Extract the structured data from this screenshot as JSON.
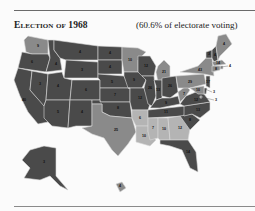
{
  "header": {
    "title": "Election of 1968",
    "subtitle": "(60.6% of electorate voting)"
  },
  "legend_colors": {
    "nixon_republican": "#4a4a4a",
    "humphrey_democratic": "#8a8a8a",
    "wallace_american_independent": "#b4b4b4"
  },
  "states": [
    {
      "abbr": "WA",
      "ev": "9",
      "party": "humphrey_democratic"
    },
    {
      "abbr": "OR",
      "ev": "6",
      "party": "nixon_republican"
    },
    {
      "abbr": "CA",
      "ev": "40",
      "party": "nixon_republican"
    },
    {
      "abbr": "NV",
      "ev": "3",
      "party": "nixon_republican"
    },
    {
      "abbr": "ID",
      "ev": "4",
      "party": "nixon_republican"
    },
    {
      "abbr": "MT",
      "ev": "4",
      "party": "nixon_republican"
    },
    {
      "abbr": "WY",
      "ev": "3",
      "party": "nixon_republican"
    },
    {
      "abbr": "UT",
      "ev": "4",
      "party": "nixon_republican"
    },
    {
      "abbr": "AZ",
      "ev": "5",
      "party": "nixon_republican"
    },
    {
      "abbr": "CO",
      "ev": "6",
      "party": "nixon_republican"
    },
    {
      "abbr": "NM",
      "ev": "4",
      "party": "nixon_republican"
    },
    {
      "abbr": "ND",
      "ev": "4",
      "party": "nixon_republican"
    },
    {
      "abbr": "SD",
      "ev": "4",
      "party": "nixon_republican"
    },
    {
      "abbr": "NE",
      "ev": "5",
      "party": "nixon_republican"
    },
    {
      "abbr": "KS",
      "ev": "7",
      "party": "nixon_republican"
    },
    {
      "abbr": "OK",
      "ev": "8",
      "party": "nixon_republican"
    },
    {
      "abbr": "TX",
      "ev": "25",
      "party": "humphrey_democratic"
    },
    {
      "abbr": "MN",
      "ev": "10",
      "party": "humphrey_democratic"
    },
    {
      "abbr": "IA",
      "ev": "9",
      "party": "nixon_republican"
    },
    {
      "abbr": "MO",
      "ev": "12",
      "party": "nixon_republican"
    },
    {
      "abbr": "AR",
      "ev": "6",
      "party": "wallace_american_independent"
    },
    {
      "abbr": "LA",
      "ev": "10",
      "party": "wallace_american_independent"
    },
    {
      "abbr": "WI",
      "ev": "12",
      "party": "nixon_republican"
    },
    {
      "abbr": "IL",
      "ev": "26",
      "party": "nixon_republican"
    },
    {
      "abbr": "MI",
      "ev": "21",
      "party": "humphrey_democratic"
    },
    {
      "abbr": "IN",
      "ev": "13",
      "party": "nixon_republican"
    },
    {
      "abbr": "OH",
      "ev": "26",
      "party": "nixon_republican"
    },
    {
      "abbr": "KY",
      "ev": "9",
      "party": "nixon_republican"
    },
    {
      "abbr": "TN",
      "ev": "11",
      "party": "nixon_republican"
    },
    {
      "abbr": "MS",
      "ev": "7",
      "party": "wallace_american_independent"
    },
    {
      "abbr": "AL",
      "ev": "10",
      "party": "wallace_american_independent"
    },
    {
      "abbr": "GA",
      "ev": "12",
      "party": "wallace_american_independent"
    },
    {
      "abbr": "FL",
      "ev": "14",
      "party": "nixon_republican"
    },
    {
      "abbr": "SC",
      "ev": "8",
      "party": "nixon_republican"
    },
    {
      "abbr": "NC",
      "ev": "13",
      "party": "nixon_republican"
    },
    {
      "abbr": "VA",
      "ev": "12",
      "party": "nixon_republican"
    },
    {
      "abbr": "WV",
      "ev": "7",
      "party": "humphrey_democratic"
    },
    {
      "abbr": "PA",
      "ev": "29",
      "party": "humphrey_democratic"
    },
    {
      "abbr": "NY",
      "ev": "43",
      "party": "humphrey_democratic"
    },
    {
      "abbr": "VT",
      "ev": "3",
      "party": "nixon_republican"
    },
    {
      "abbr": "NH",
      "ev": "4",
      "party": "nixon_republican"
    },
    {
      "abbr": "ME",
      "ev": "4",
      "party": "humphrey_democratic"
    },
    {
      "abbr": "MA",
      "ev": "14",
      "party": "humphrey_democratic"
    },
    {
      "abbr": "RI",
      "ev": "4",
      "party": "humphrey_democratic"
    },
    {
      "abbr": "CT",
      "ev": "8",
      "party": "humphrey_democratic"
    },
    {
      "abbr": "NJ",
      "ev": "17",
      "party": "nixon_republican"
    },
    {
      "abbr": "DE",
      "ev": "3",
      "party": "nixon_republican"
    },
    {
      "abbr": "MD",
      "ev": "10",
      "party": "humphrey_democratic"
    },
    {
      "abbr": "DC",
      "ev": "3",
      "party": "humphrey_democratic"
    },
    {
      "abbr": "AK",
      "ev": "3",
      "party": "nixon_republican"
    },
    {
      "abbr": "HI",
      "ev": "4",
      "party": "humphrey_democratic"
    }
  ]
}
